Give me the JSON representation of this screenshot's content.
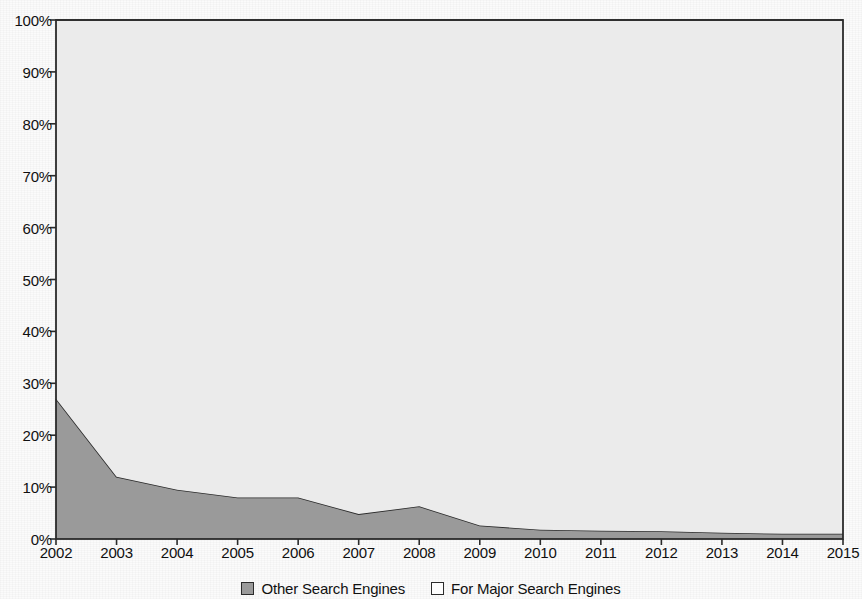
{
  "chart_data": {
    "type": "area",
    "title": "",
    "subtitle": "",
    "xlabel": "",
    "ylabel": "",
    "stacked": true,
    "stack_total_percent": 100,
    "grid": false,
    "legend_position": "bottom",
    "x": [
      2002,
      2003,
      2004,
      2005,
      2006,
      2007,
      2008,
      2009,
      2010,
      2011,
      2012,
      2013,
      2014,
      2015
    ],
    "categories": [
      "2002",
      "2003",
      "2004",
      "2005",
      "2006",
      "2007",
      "2008",
      "2009",
      "2010",
      "2011",
      "2012",
      "2013",
      "2014",
      "2015"
    ],
    "xlim": [
      2002,
      2015
    ],
    "ylim": [
      0,
      100
    ],
    "ytick_labels": [
      "100%",
      "90%",
      "80%",
      "70%",
      "60%",
      "50%",
      "40%",
      "30%",
      "20%",
      "10%",
      "0%"
    ],
    "ytick_values": [
      100,
      90,
      80,
      70,
      60,
      50,
      40,
      30,
      20,
      10,
      0
    ],
    "series": [
      {
        "name": "Other Search Engines",
        "color": "#9a9a9a",
        "swatch": "filled",
        "values": [
          27,
          12,
          9.5,
          8,
          8,
          4.8,
          6.3,
          2.6,
          1.8,
          1.6,
          1.5,
          1.2,
          1,
          1
        ]
      },
      {
        "name": "For Major Search Engines",
        "color": "#ebebeb",
        "swatch": "hollow",
        "values": [
          73,
          88,
          90.5,
          92,
          92,
          95.2,
          93.7,
          97.4,
          98.2,
          98.4,
          98.5,
          98.8,
          99,
          99
        ]
      }
    ]
  },
  "legend": {
    "entries": [
      {
        "label": "Other Search Engines",
        "swatch": "filled"
      },
      {
        "label": "For Major Search Engines",
        "swatch": "hollow"
      }
    ]
  },
  "colors": {
    "other_search_engines": "#9a9a9a",
    "major_search_engines": "#ebebeb",
    "axis": "#2b2b2b",
    "text": "#101010",
    "paper": "#fbfbfb"
  }
}
